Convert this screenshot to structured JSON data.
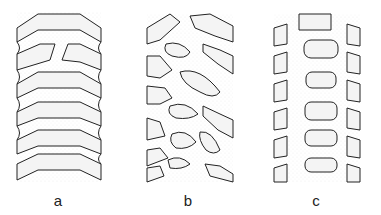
{
  "figure": {
    "panels": [
      {
        "id": "a",
        "label": "a",
        "pattern": "continuous curved bands (chevron-shaped thickenings)",
        "band_count": 6
      },
      {
        "id": "b",
        "label": "b",
        "pattern": "diagonal reticulate/oblique lens-shaped thickenings"
      },
      {
        "id": "c",
        "label": "c",
        "pattern": "transverse oval thickenings in a vertical column with lateral bands"
      }
    ]
  }
}
